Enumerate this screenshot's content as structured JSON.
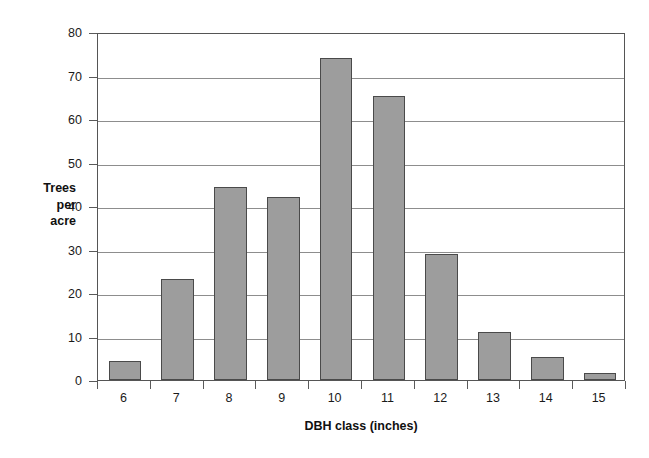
{
  "chart_data": {
    "type": "bar",
    "title": "",
    "subtitle": "",
    "xlabel": "DBH class (inches)",
    "ylabel": "Trees per acre",
    "ylabel_lines": [
      "Trees",
      "per",
      "acre"
    ],
    "categories": [
      "6",
      "7",
      "8",
      "9",
      "10",
      "11",
      "12",
      "13",
      "14",
      "15"
    ],
    "values": [
      4.3,
      23.3,
      44.3,
      42.0,
      74.0,
      65.3,
      29.0,
      11.0,
      5.3,
      1.7
    ],
    "series": [
      {
        "name": "Trees per acre",
        "values": [
          4.3,
          23.3,
          44.3,
          42.0,
          74.0,
          65.3,
          29.0,
          11.0,
          5.3,
          1.7
        ]
      }
    ],
    "ylim": [
      0,
      80
    ],
    "ytick_values": [
      0,
      10,
      20,
      30,
      40,
      50,
      60,
      70,
      80
    ],
    "ytick_labels": [
      "0",
      "10",
      "20",
      "30",
      "40",
      "50",
      "60",
      "70",
      "80"
    ],
    "xtick_labels": [
      "6",
      "7",
      "8",
      "9",
      "10",
      "11",
      "12",
      "13",
      "14",
      "15"
    ],
    "grid": "horizontal",
    "legend": "none",
    "bar_color": "#9d9d9d",
    "bar_border_color": "#4a4a4a",
    "grid_color": "#8d8d8d",
    "axis_color": "#555555",
    "background_color": "#ffffff",
    "text_color": "#1a1a1a"
  }
}
